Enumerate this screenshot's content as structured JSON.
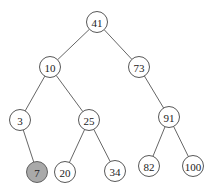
{
  "diagram": {
    "type": "binary-search-tree",
    "nodes": [
      {
        "id": "n41",
        "label": "41",
        "x": 97,
        "y": 22,
        "highlight": false
      },
      {
        "id": "n10",
        "label": "10",
        "x": 50,
        "y": 67,
        "highlight": false
      },
      {
        "id": "n73",
        "label": "73",
        "x": 139,
        "y": 67,
        "highlight": false
      },
      {
        "id": "n3",
        "label": "3",
        "x": 20,
        "y": 120,
        "highlight": false
      },
      {
        "id": "n25",
        "label": "25",
        "x": 89,
        "y": 120,
        "highlight": false
      },
      {
        "id": "n91",
        "label": "91",
        "x": 169,
        "y": 117,
        "highlight": false
      },
      {
        "id": "n7",
        "label": "7",
        "x": 37,
        "y": 172,
        "highlight": true
      },
      {
        "id": "n20",
        "label": "20",
        "x": 65,
        "y": 172,
        "highlight": false
      },
      {
        "id": "n34",
        "label": "34",
        "x": 115,
        "y": 171,
        "highlight": false
      },
      {
        "id": "n82",
        "label": "82",
        "x": 149,
        "y": 166,
        "highlight": false
      },
      {
        "id": "n100",
        "label": "100",
        "x": 193,
        "y": 166,
        "highlight": false
      }
    ],
    "edges": [
      [
        "n41",
        "n10"
      ],
      [
        "n41",
        "n73"
      ],
      [
        "n10",
        "n3"
      ],
      [
        "n10",
        "n25"
      ],
      [
        "n73",
        "n91"
      ],
      [
        "n3",
        "n7"
      ],
      [
        "n25",
        "n20"
      ],
      [
        "n25",
        "n34"
      ],
      [
        "n91",
        "n82"
      ],
      [
        "n91",
        "n100"
      ]
    ],
    "highlight_color": "#a9a9a9"
  }
}
